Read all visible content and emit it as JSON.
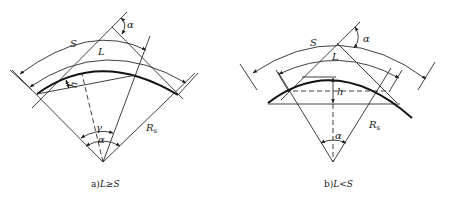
{
  "diagram_a": {
    "caption_prefix": "a)",
    "caption_condition": "L≥S",
    "labels": {
      "S": "S",
      "L": "L",
      "h": "h",
      "alpha_top": "α",
      "gamma": "γ",
      "alpha_center": "α",
      "radius": "R",
      "radius_sub": "s"
    }
  },
  "diagram_b": {
    "caption_prefix": "b)",
    "caption_condition": "L<S",
    "labels": {
      "S": "S",
      "L": "L",
      "h": "h",
      "alpha_top": "α",
      "alpha_center": "α",
      "radius": "R",
      "radius_sub": "s"
    }
  }
}
